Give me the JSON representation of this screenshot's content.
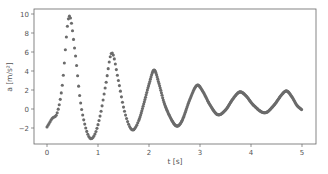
{
  "chart_data": {
    "type": "scatter",
    "title": "",
    "xlabel": "t [s]",
    "ylabel": "a [m/s²]",
    "xlim": [
      -0.25,
      5.3
    ],
    "ylim": [
      -3.6,
      10.2
    ],
    "xticks": [
      0,
      1,
      2,
      3,
      4,
      5
    ],
    "yticks": [
      -2,
      0,
      2,
      4,
      6,
      8,
      10
    ],
    "grid": false,
    "legend": null,
    "marker_color": "#6b6b6b",
    "series": [
      {
        "name": "acceleration",
        "anchors": [
          [
            0,
            -1.9
          ],
          [
            0.1,
            -1.0
          ],
          [
            0.2,
            -0.4
          ],
          [
            0.3,
            2.5
          ],
          [
            0.43,
            9.7
          ],
          [
            0.55,
            6.0
          ],
          [
            0.65,
            1.0
          ],
          [
            0.75,
            -1.8
          ],
          [
            0.85,
            -3.1
          ],
          [
            0.95,
            -2.5
          ],
          [
            1.05,
            -0.5
          ],
          [
            1.15,
            2.5
          ],
          [
            1.27,
            5.9
          ],
          [
            1.4,
            3.0
          ],
          [
            1.5,
            0.2
          ],
          [
            1.6,
            -1.6
          ],
          [
            1.69,
            -2.2
          ],
          [
            1.8,
            -1.2
          ],
          [
            1.9,
            0.6
          ],
          [
            2.0,
            2.6
          ],
          [
            2.1,
            4.1
          ],
          [
            2.2,
            2.6
          ],
          [
            2.3,
            0.6
          ],
          [
            2.45,
            -1.2
          ],
          [
            2.55,
            -1.8
          ],
          [
            2.65,
            -1.2
          ],
          [
            2.8,
            1.0
          ],
          [
            2.94,
            2.5
          ],
          [
            3.05,
            1.9
          ],
          [
            3.2,
            0.4
          ],
          [
            3.35,
            -0.6
          ],
          [
            3.5,
            -0.1
          ],
          [
            3.65,
            1.1
          ],
          [
            3.78,
            1.8
          ],
          [
            3.9,
            1.4
          ],
          [
            4.05,
            0.4
          ],
          [
            4.27,
            -0.4
          ],
          [
            4.45,
            0.4
          ],
          [
            4.6,
            1.5
          ],
          [
            4.7,
            1.9
          ],
          [
            4.8,
            1.3
          ],
          [
            4.9,
            0.4
          ],
          [
            5.0,
            -0.1
          ]
        ],
        "sample_dt_first": 0.02,
        "sample_dt_rest": 0.012
      }
    ],
    "extrema": {
      "peaks": [
        [
          0.43,
          9.7
        ],
        [
          1.27,
          5.9
        ],
        [
          2.1,
          4.1
        ],
        [
          2.94,
          2.5
        ],
        [
          3.78,
          1.8
        ],
        [
          4.7,
          1.9
        ]
      ],
      "troughs": [
        [
          0.85,
          -3.1
        ],
        [
          1.69,
          -2.2
        ],
        [
          2.55,
          -1.8
        ],
        [
          3.35,
          -0.6
        ],
        [
          4.27,
          -0.4
        ]
      ]
    }
  }
}
